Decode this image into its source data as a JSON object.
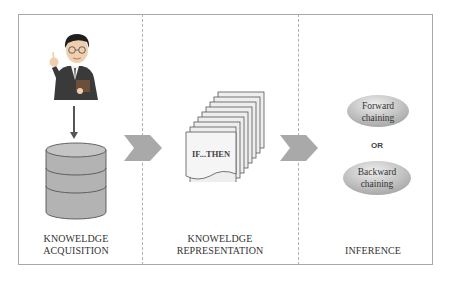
{
  "stages": [
    {
      "id": "acquisition",
      "label_line1": "KNOWELDGE",
      "label_line2": "ACQUISITION",
      "icons": [
        "person-icon",
        "down-arrow-icon",
        "database-icon"
      ]
    },
    {
      "id": "representation",
      "label_line1": "KNOWELDGE",
      "label_line2": "REPRESENTATION",
      "document_text": "IF...THEN",
      "icons": [
        "stacked-documents-icon"
      ]
    },
    {
      "id": "inference",
      "label": "INFERENCE",
      "options": [
        {
          "line1": "Forward",
          "line2": "chaining"
        },
        {
          "line1": "Backward",
          "line2": "chaining"
        }
      ],
      "connector": "OR"
    }
  ],
  "colors": {
    "border": "#a8a8a8",
    "chevron": "#a9a9a9",
    "database": "#b3b3b3",
    "ellipse": "#c8c8c8",
    "text": "#333333"
  }
}
